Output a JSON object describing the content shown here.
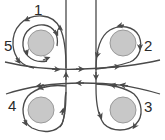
{
  "diagram": {
    "colors": {
      "stroke": "#4a4a4a",
      "circle_fill": "#c8c8c8",
      "circle_stroke": "#9a9a9a",
      "background": "#ffffff"
    },
    "labels": [
      {
        "id": "1",
        "text": "1"
      },
      {
        "id": "2",
        "text": "2"
      },
      {
        "id": "3",
        "text": "3"
      },
      {
        "id": "4",
        "text": "4"
      },
      {
        "id": "5",
        "text": "5"
      }
    ],
    "nodes": [
      {
        "name": "circle-top-left",
        "label": "5"
      },
      {
        "name": "circle-top-right",
        "label": "2"
      },
      {
        "name": "circle-bottom-left",
        "label": "4"
      },
      {
        "name": "circle-bottom-right",
        "label": "3"
      }
    ],
    "outer_loop_label": "1"
  }
}
